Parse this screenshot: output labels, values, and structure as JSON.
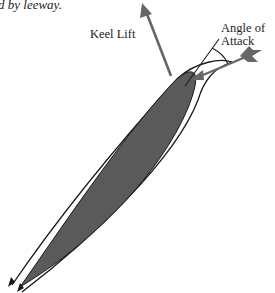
{
  "caption": "d by leeway.",
  "labels": {
    "keel_lift": "Keel Lift",
    "angle_of_attack_line1": "Angle of",
    "angle_of_attack_line2": "Attack"
  },
  "colors": {
    "foil_fill": "#5a5a5a",
    "arrow_gray": "#666666",
    "line": "#1a1a1a",
    "background": "#ffffff"
  }
}
